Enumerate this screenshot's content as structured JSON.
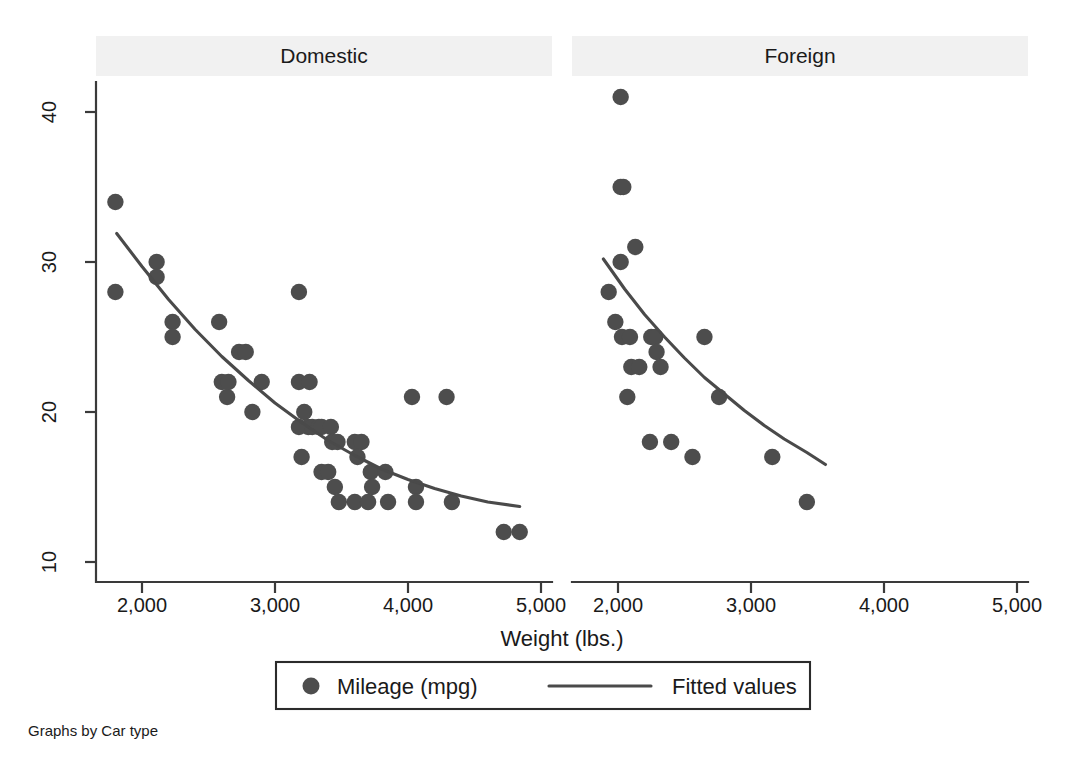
{
  "figure": {
    "note": "Graphs by Car type",
    "xlabel": "Weight (lbs.)",
    "panels": [
      "Domestic",
      "Foreign"
    ]
  },
  "legend": {
    "marker_label": "Mileage (mpg)",
    "line_label": "Fitted values",
    "marker_icon": "filled-circle-marker",
    "line_icon": "line-segment-marker"
  },
  "axes": {
    "x_ticks": [
      "2,000",
      "3,000",
      "4,000",
      "5,000"
    ],
    "y_ticks": [
      "10",
      "20",
      "30",
      "40"
    ]
  },
  "colors": {
    "point": "#4d4d4d",
    "line": "#4a4a4a",
    "axis": "#3a3a3a",
    "text": "#1a1a1a",
    "background": "#ffffff",
    "title_band": "#f1f1f1"
  },
  "chart_data": {
    "type": "scatter",
    "title": "",
    "subtitle": "",
    "xlabel": "Weight (lbs.)",
    "ylabel": "",
    "xlim": [
      1600,
      5200
    ],
    "ylim": [
      9,
      42
    ],
    "xticks": [
      2000,
      3000,
      4000,
      5000
    ],
    "yticks": [
      10,
      20,
      30,
      40
    ],
    "xtick_labels": [
      "2,000",
      "3,000",
      "4,000",
      "5,000"
    ],
    "ytick_labels": [
      "10",
      "20",
      "30",
      "40"
    ],
    "grid": false,
    "legend_position": "bottom-center",
    "facet_by": "Car type",
    "note": "Graphs by Car type",
    "panels": [
      {
        "name": "Domestic",
        "series": [
          {
            "name": "Mileage (mpg)",
            "type": "scatter",
            "marker": "circle",
            "color": "#4d4d4d",
            "points": [
              {
                "x": 1800,
                "y": 34
              },
              {
                "x": 1800,
                "y": 28
              },
              {
                "x": 2110,
                "y": 30
              },
              {
                "x": 2110,
                "y": 29
              },
              {
                "x": 2230,
                "y": 26
              },
              {
                "x": 2230,
                "y": 25
              },
              {
                "x": 2580,
                "y": 26
              },
              {
                "x": 2600,
                "y": 22
              },
              {
                "x": 2650,
                "y": 22
              },
              {
                "x": 2640,
                "y": 21
              },
              {
                "x": 2730,
                "y": 24
              },
              {
                "x": 2780,
                "y": 24
              },
              {
                "x": 2830,
                "y": 20
              },
              {
                "x": 2900,
                "y": 22
              },
              {
                "x": 3180,
                "y": 28
              },
              {
                "x": 3180,
                "y": 22
              },
              {
                "x": 3260,
                "y": 22
              },
              {
                "x": 3220,
                "y": 20
              },
              {
                "x": 3250,
                "y": 19
              },
              {
                "x": 3180,
                "y": 19
              },
              {
                "x": 3280,
                "y": 19
              },
              {
                "x": 3330,
                "y": 19
              },
              {
                "x": 3350,
                "y": 19
              },
              {
                "x": 3200,
                "y": 17
              },
              {
                "x": 3420,
                "y": 19
              },
              {
                "x": 3430,
                "y": 18
              },
              {
                "x": 3470,
                "y": 18
              },
              {
                "x": 3350,
                "y": 16
              },
              {
                "x": 3400,
                "y": 16
              },
              {
                "x": 3600,
                "y": 18
              },
              {
                "x": 3650,
                "y": 18
              },
              {
                "x": 3620,
                "y": 17
              },
              {
                "x": 3450,
                "y": 15
              },
              {
                "x": 3480,
                "y": 14
              },
              {
                "x": 3600,
                "y": 14
              },
              {
                "x": 3700,
                "y": 14
              },
              {
                "x": 3720,
                "y": 16
              },
              {
                "x": 3730,
                "y": 15
              },
              {
                "x": 3830,
                "y": 16
              },
              {
                "x": 3850,
                "y": 14
              },
              {
                "x": 4030,
                "y": 21
              },
              {
                "x": 4060,
                "y": 15
              },
              {
                "x": 4060,
                "y": 14
              },
              {
                "x": 4290,
                "y": 21
              },
              {
                "x": 4330,
                "y": 14
              },
              {
                "x": 4720,
                "y": 12
              },
              {
                "x": 4840,
                "y": 12
              }
            ]
          },
          {
            "name": "Fitted values",
            "type": "line",
            "color": "#4a4a4a",
            "points": [
              {
                "x": 1810,
                "y": 31.9
              },
              {
                "x": 2000,
                "y": 29.7
              },
              {
                "x": 2200,
                "y": 27.5
              },
              {
                "x": 2400,
                "y": 25.5
              },
              {
                "x": 2600,
                "y": 23.7
              },
              {
                "x": 2800,
                "y": 22.1
              },
              {
                "x": 3000,
                "y": 20.6
              },
              {
                "x": 3200,
                "y": 19.3
              },
              {
                "x": 3400,
                "y": 18.1
              },
              {
                "x": 3600,
                "y": 17.1
              },
              {
                "x": 3800,
                "y": 16.2
              },
              {
                "x": 4000,
                "y": 15.5
              },
              {
                "x": 4200,
                "y": 14.9
              },
              {
                "x": 4400,
                "y": 14.4
              },
              {
                "x": 4600,
                "y": 14.0
              },
              {
                "x": 4840,
                "y": 13.7
              }
            ]
          }
        ]
      },
      {
        "name": "Foreign",
        "series": [
          {
            "name": "Mileage (mpg)",
            "type": "scatter",
            "marker": "circle",
            "color": "#4d4d4d",
            "points": [
              {
                "x": 2020,
                "y": 41
              },
              {
                "x": 2020,
                "y": 35
              },
              {
                "x": 2040,
                "y": 35
              },
              {
                "x": 2130,
                "y": 31
              },
              {
                "x": 2020,
                "y": 30
              },
              {
                "x": 1930,
                "y": 28
              },
              {
                "x": 1980,
                "y": 26
              },
              {
                "x": 2030,
                "y": 25
              },
              {
                "x": 2090,
                "y": 25
              },
              {
                "x": 2250,
                "y": 25
              },
              {
                "x": 2280,
                "y": 25
              },
              {
                "x": 2100,
                "y": 23
              },
              {
                "x": 2160,
                "y": 23
              },
              {
                "x": 2290,
                "y": 24
              },
              {
                "x": 2320,
                "y": 23
              },
              {
                "x": 2650,
                "y": 25
              },
              {
                "x": 2070,
                "y": 21
              },
              {
                "x": 2240,
                "y": 18
              },
              {
                "x": 2400,
                "y": 18
              },
              {
                "x": 2760,
                "y": 21
              },
              {
                "x": 2560,
                "y": 17
              },
              {
                "x": 3160,
                "y": 17
              },
              {
                "x": 3420,
                "y": 14
              }
            ]
          },
          {
            "name": "Fitted values",
            "type": "line",
            "color": "#4a4a4a",
            "points": [
              {
                "x": 1890,
                "y": 30.2
              },
              {
                "x": 2050,
                "y": 28.2
              },
              {
                "x": 2200,
                "y": 26.5
              },
              {
                "x": 2350,
                "y": 25.0
              },
              {
                "x": 2500,
                "y": 23.6
              },
              {
                "x": 2650,
                "y": 22.3
              },
              {
                "x": 2800,
                "y": 21.2
              },
              {
                "x": 2950,
                "y": 20.1
              },
              {
                "x": 3100,
                "y": 19.1
              },
              {
                "x": 3250,
                "y": 18.2
              },
              {
                "x": 3420,
                "y": 17.3
              },
              {
                "x": 3560,
                "y": 16.5
              }
            ]
          }
        ]
      }
    ]
  }
}
